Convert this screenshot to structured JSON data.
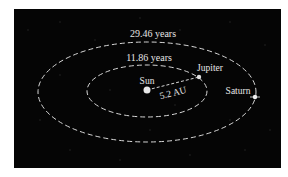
{
  "diagram": {
    "colors": {
      "background": "#050505",
      "orbit": "#d8d8d8",
      "text": "#e6e6e6"
    },
    "orbits": [
      {
        "name": "saturn-orbit",
        "period_label": "29.46 years"
      },
      {
        "name": "jupiter-orbit",
        "period_label": "11.86 years"
      }
    ],
    "bodies": {
      "sun": "Sun",
      "jupiter": "Jupiter",
      "saturn": "Saturn"
    },
    "distance_label": "5.2 AU"
  }
}
